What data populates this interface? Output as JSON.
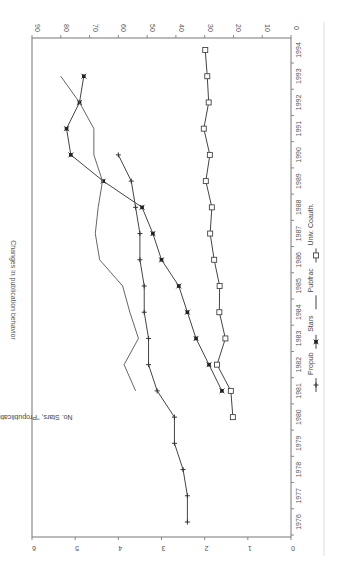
{
  "chart_data": {
    "type": "line",
    "title": "Changes in publication behavior",
    "orientation": "rotated-90-clockwise",
    "xlabel": "",
    "ylabel": "No. Stars, \"Propublication\" behavior",
    "y2label": "",
    "x": [
      1976,
      1977,
      1978,
      1979,
      1980,
      1981,
      1982,
      1983,
      1984,
      1985,
      1986,
      1987,
      1988,
      1989,
      1990,
      1991,
      1992,
      1993,
      1994
    ],
    "xticks": [
      "1976",
      "1977",
      "1978",
      "1979",
      "1980",
      "1981",
      "1982",
      "1983",
      "1984",
      "1985",
      "1986",
      "1987",
      "1988",
      "1989",
      "1990",
      "1991",
      "1992",
      "1993",
      "1994"
    ],
    "ylim": [
      0,
      6
    ],
    "yticks": [
      "0",
      "1",
      "2",
      "3",
      "4",
      "5",
      "6"
    ],
    "y2lim": [
      0,
      90
    ],
    "y2ticks": [
      "0",
      "10",
      "20",
      "30",
      "40",
      "50",
      "60",
      "70",
      "80",
      "90"
    ],
    "grid": false,
    "legend_position": "bottom",
    "series": [
      {
        "name": "Propub",
        "axis": "left",
        "marker": "plus",
        "x": [
          1976,
          1977,
          1978,
          1979,
          1980,
          1981,
          1982,
          1983,
          1984,
          1985,
          1986,
          1987,
          1988,
          1989,
          1990
        ],
        "values": [
          2.4,
          2.4,
          2.5,
          2.7,
          2.7,
          3.1,
          3.3,
          3.3,
          3.4,
          3.4,
          3.5,
          3.5,
          3.6,
          3.7,
          4.0
        ]
      },
      {
        "name": "Stars",
        "axis": "left",
        "marker": "star",
        "x": [
          1981,
          1982,
          1983,
          1984,
          1985,
          1986,
          1987,
          1988,
          1989,
          1990,
          1991,
          1992,
          1993
        ],
        "values": [
          1.6,
          1.9,
          2.2,
          2.4,
          2.6,
          3.0,
          3.2,
          3.45,
          4.35,
          5.1,
          5.2,
          4.9,
          4.8
        ]
      },
      {
        "name": "Pubfrac",
        "axis": "right",
        "marker": "none",
        "x": [
          1981,
          1982,
          1983,
          1984,
          1985,
          1986,
          1987,
          1988,
          1989,
          1990,
          1991,
          1992,
          1993
        ],
        "values": [
          54,
          58,
          53,
          56,
          58.5,
          66.5,
          68,
          67,
          65.5,
          68.5,
          68.5,
          73.5,
          80
        ]
      },
      {
        "name": "Univ. Coauth.",
        "axis": "right",
        "marker": "square",
        "x": [
          1980,
          1981,
          1982,
          1983,
          1984,
          1985,
          1986,
          1987,
          1988,
          1989,
          1990,
          1991,
          1992,
          1993,
          1994
        ],
        "values": [
          20.2,
          20.9,
          25.7,
          22.8,
          24.9,
          24.8,
          26.7,
          28.1,
          27.5,
          29.6,
          28.2,
          30.3,
          28.6,
          29.1,
          29.8
        ]
      }
    ]
  }
}
